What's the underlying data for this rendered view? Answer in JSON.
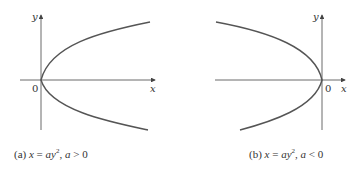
{
  "figures": [
    {
      "id": "a",
      "caption_prefix": "(a)",
      "equation_lhs": "x",
      "equation_rhs": "ay",
      "exponent": "2",
      "condition_var": "a",
      "condition_op": ">",
      "condition_val": "0",
      "axis_x_label": "x",
      "axis_y_label": "y",
      "origin_label": "0"
    },
    {
      "id": "b",
      "caption_prefix": "(b)",
      "equation_lhs": "x",
      "equation_rhs": "ay",
      "exponent": "2",
      "condition_var": "a",
      "condition_op": "<",
      "condition_val": "0",
      "axis_x_label": "x",
      "axis_y_label": "y",
      "origin_label": "0"
    }
  ],
  "colors": {
    "curve": "#555555",
    "axis": "#444444"
  }
}
